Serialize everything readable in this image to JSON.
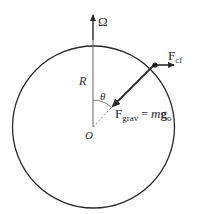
{
  "diagram": {
    "labels": {
      "omega": "Ω",
      "radius": "R",
      "angle": "θ",
      "origin": "O",
      "f_cf_main": "F",
      "f_cf_sub": "cf",
      "f_grav_main": "F",
      "f_grav_sub": "grav",
      "f_grav_eq": " = ",
      "f_grav_m": "m",
      "f_grav_g": "g",
      "f_grav_g_sub": "o"
    },
    "colors": {
      "line": "#2a2a2a",
      "thin_line": "#666666",
      "background": "#ffffff"
    }
  }
}
